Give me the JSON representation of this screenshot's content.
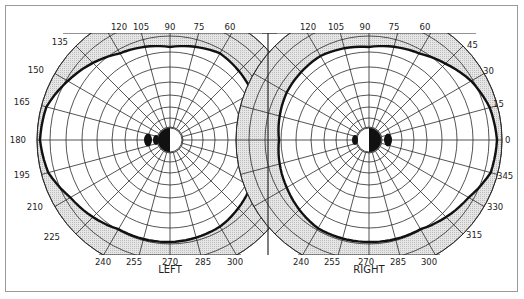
{
  "figure": {
    "eyes": [
      {
        "id": "left",
        "label": "LEFT",
        "center": [
          170,
          140
        ]
      },
      {
        "id": "right",
        "label": "RIGHT",
        "center": [
          369,
          140
        ]
      }
    ],
    "left_angle_labels": [
      "120",
      "105",
      "90",
      "75",
      "60",
      "135",
      "150",
      "165",
      "180",
      "195",
      "210",
      "225",
      "240",
      "255",
      "270",
      "285",
      "300"
    ],
    "right_angle_labels": [
      "120",
      "105",
      "90",
      "75",
      "60",
      "45",
      "30",
      "15",
      "0",
      "345",
      "330",
      "315",
      "240",
      "255",
      "270",
      "285",
      "300"
    ],
    "colors": {
      "grid": "#2a2a2a",
      "shade": "#d9d9d9",
      "isopter": "#111111",
      "blind_spot": "#111111",
      "frame": "#9a9a9a"
    }
  },
  "chart_data": {
    "type": "polar-diagram",
    "title": "",
    "panels": [
      {
        "name": "LEFT",
        "angle_ticks_deg": [
          60,
          75,
          90,
          105,
          120,
          135,
          150,
          165,
          180,
          195,
          210,
          225,
          240,
          255,
          270,
          285,
          300
        ],
        "rings": 10,
        "isopter_radius_px_by_angle": {
          "0": 90,
          "30": 95,
          "60": 100,
          "90": 93,
          "120": 100,
          "150": 118,
          "165": 128,
          "180": 130,
          "195": 126,
          "210": 115,
          "240": 103,
          "270": 102,
          "300": 100,
          "330": 93
        },
        "blind_spot": "temporal (left of fixation)"
      },
      {
        "name": "RIGHT",
        "angle_ticks_deg": [
          0,
          15,
          30,
          45,
          60,
          75,
          90,
          105,
          120,
          240,
          255,
          270,
          285,
          300,
          315,
          330,
          345
        ],
        "rings": 10,
        "isopter_radius_px_by_angle": {
          "0": 128,
          "15": 125,
          "30": 118,
          "45": 108,
          "60": 100,
          "90": 93,
          "120": 97,
          "150": 95,
          "180": 90,
          "210": 95,
          "240": 102,
          "270": 102,
          "300": 103,
          "330": 115,
          "345": 126
        },
        "blind_spot": "temporal (right of fixation)"
      }
    ],
    "legend": [],
    "grid": true
  }
}
